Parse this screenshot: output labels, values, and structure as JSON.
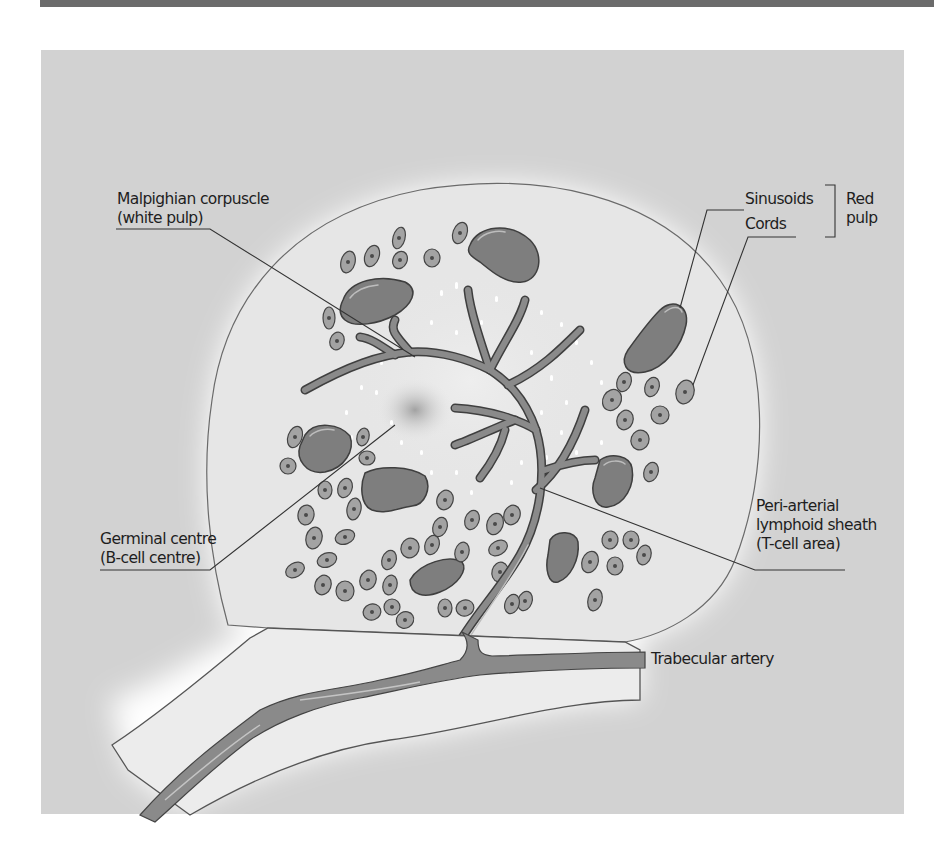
{
  "figure": {
    "colors": {
      "top_band": "#6b6b6b",
      "panel_background": "#d2d2d2",
      "pulp_background": "#e6e6e6",
      "glow": "#ffffff",
      "vessel_fill": "#8a8a8a",
      "sinusoid_fill": "#7e7e7e",
      "cell_fill": "#a3a3a3",
      "outline": "#444444",
      "leader_line": "#333333",
      "text": "#1e1e1e"
    }
  },
  "labels": {
    "malpighian": {
      "line1": "Malpighian corpuscle",
      "line2": "(white pulp)"
    },
    "sinusoids": "Sinusoids",
    "cords": "Cords",
    "red_pulp": {
      "line1": "Red",
      "line2": "pulp"
    },
    "germinal": {
      "line1": "Germinal centre",
      "line2": "(B-cell centre)"
    },
    "pals": {
      "line1": "Peri-arterial",
      "line2": "lymphoid sheath",
      "line3": "(T-cell area)"
    },
    "trabecular": "Trabecular artery"
  }
}
